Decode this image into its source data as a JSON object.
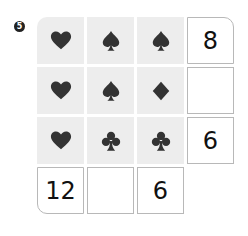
{
  "puzzle": {
    "number_label": "5",
    "grid": [
      [
        "heart",
        "spade",
        "spade"
      ],
      [
        "heart",
        "spade",
        "diamond"
      ],
      [
        "heart",
        "club",
        "club"
      ]
    ],
    "row_sums": [
      "8",
      "",
      "6"
    ],
    "col_sums": [
      "12",
      "",
      "6"
    ],
    "suit_color": "#333333",
    "cell_bg": "#ededed"
  }
}
